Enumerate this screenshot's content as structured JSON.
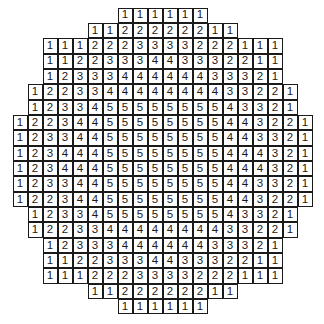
{
  "diagram": {
    "type": "numbered-cell-grid",
    "columns": 20,
    "rows": [
      {
        "start_col": 7,
        "values": [
          "1",
          "1",
          "1",
          "1",
          "1",
          "1"
        ]
      },
      {
        "start_col": 5,
        "values": [
          "1",
          "1",
          "2",
          "2",
          "2",
          "2",
          "2",
          "2",
          "1",
          "1"
        ]
      },
      {
        "start_col": 2,
        "values": [
          "1",
          "1",
          "1",
          "2",
          "2",
          "2",
          "3",
          "3",
          "3",
          "3",
          "2",
          "2",
          "2",
          "1",
          "1",
          "1"
        ]
      },
      {
        "start_col": 2,
        "values": [
          "1",
          "1",
          "2",
          "2",
          "3",
          "3",
          "3",
          "4",
          "4",
          "3",
          "3",
          "3",
          "2",
          "2",
          "1",
          "1"
        ]
      },
      {
        "start_col": 2,
        "values": [
          "1",
          "2",
          "3",
          "3",
          "3",
          "4",
          "4",
          "4",
          "4",
          "4",
          "4",
          "3",
          "3",
          "3",
          "2",
          "1"
        ]
      },
      {
        "start_col": 1,
        "values": [
          "1",
          "2",
          "2",
          "3",
          "3",
          "4",
          "4",
          "4",
          "4",
          "4",
          "4",
          "4",
          "4",
          "3",
          "3",
          "2",
          "2",
          "1"
        ]
      },
      {
        "start_col": 1,
        "values": [
          "1",
          "2",
          "3",
          "3",
          "4",
          "5",
          "5",
          "5",
          "5",
          "5",
          "5",
          "5",
          "5",
          "4",
          "3",
          "3",
          "2",
          "1"
        ]
      },
      {
        "start_col": 0,
        "values": [
          "1",
          "2",
          "2",
          "3",
          "4",
          "4",
          "5",
          "5",
          "5",
          "5",
          "5",
          "5",
          "5",
          "5",
          "4",
          "4",
          "3",
          "2",
          "2",
          "1"
        ]
      },
      {
        "start_col": 0,
        "values": [
          "1",
          "2",
          "3",
          "3",
          "4",
          "4",
          "5",
          "5",
          "5",
          "5",
          "5",
          "5",
          "5",
          "5",
          "4",
          "4",
          "3",
          "3",
          "2",
          "1"
        ]
      },
      {
        "start_col": 0,
        "values": [
          "1",
          "2",
          "3",
          "4",
          "4",
          "4",
          "5",
          "5",
          "5",
          "5",
          "5",
          "5",
          "5",
          "5",
          "4",
          "4",
          "4",
          "3",
          "2",
          "1"
        ]
      },
      {
        "start_col": 0,
        "values": [
          "1",
          "2",
          "3",
          "4",
          "4",
          "4",
          "5",
          "5",
          "5",
          "5",
          "5",
          "5",
          "5",
          "5",
          "4",
          "4",
          "4",
          "3",
          "2",
          "1"
        ]
      },
      {
        "start_col": 0,
        "values": [
          "1",
          "2",
          "3",
          "3",
          "4",
          "4",
          "5",
          "5",
          "5",
          "5",
          "5",
          "5",
          "5",
          "5",
          "4",
          "4",
          "3",
          "3",
          "2",
          "1"
        ]
      },
      {
        "start_col": 0,
        "values": [
          "1",
          "2",
          "2",
          "3",
          "4",
          "4",
          "5",
          "5",
          "5",
          "5",
          "5",
          "5",
          "5",
          "5",
          "4",
          "4",
          "3",
          "2",
          "2",
          "1"
        ]
      },
      {
        "start_col": 1,
        "values": [
          "1",
          "2",
          "3",
          "3",
          "4",
          "5",
          "5",
          "5",
          "5",
          "5",
          "5",
          "5",
          "5",
          "4",
          "3",
          "3",
          "2",
          "1"
        ]
      },
      {
        "start_col": 1,
        "values": [
          "1",
          "2",
          "2",
          "3",
          "3",
          "4",
          "4",
          "4",
          "4",
          "4",
          "4",
          "4",
          "4",
          "3",
          "3",
          "2",
          "2",
          "1"
        ]
      },
      {
        "start_col": 2,
        "values": [
          "1",
          "2",
          "3",
          "3",
          "3",
          "4",
          "4",
          "4",
          "4",
          "4",
          "4",
          "3",
          "3",
          "3",
          "2",
          "1"
        ]
      },
      {
        "start_col": 2,
        "values": [
          "1",
          "1",
          "2",
          "2",
          "3",
          "3",
          "3",
          "4",
          "4",
          "3",
          "3",
          "3",
          "2",
          "2",
          "1",
          "1"
        ]
      },
      {
        "start_col": 2,
        "values": [
          "1",
          "1",
          "1",
          "2",
          "2",
          "2",
          "3",
          "3",
          "3",
          "3",
          "2",
          "2",
          "2",
          "1",
          "1",
          "1"
        ]
      },
      {
        "start_col": 5,
        "values": [
          "1",
          "1",
          "2",
          "2",
          "2",
          "2",
          "2",
          "2",
          "1",
          "1"
        ]
      },
      {
        "start_col": 7,
        "values": [
          "1",
          "1",
          "1",
          "1",
          "1",
          "1"
        ]
      }
    ]
  }
}
